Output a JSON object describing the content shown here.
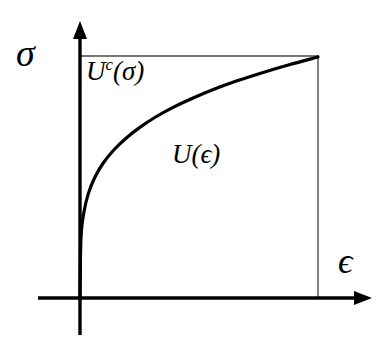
{
  "figure": {
    "background_color": "#ffffff",
    "stroke_color": "#000000",
    "axes": {
      "y_axis_label": "σ",
      "x_axis_label": "ϵ",
      "y_axis_name": "stress",
      "x_axis_name": "strain"
    },
    "regions": [
      {
        "id": "complementary",
        "label_base": "U",
        "label_superscript": "c",
        "label_argument": "(σ)",
        "label_full": "Uᶜ(σ)",
        "description": "complementary strain energy, area between curve and stress axis"
      },
      {
        "id": "strain",
        "label_base": "U",
        "label_superscript": "",
        "label_argument": "(ϵ)",
        "label_full": "U(ϵ)",
        "description": "strain energy, area between curve and strain axis"
      }
    ]
  },
  "chart_data": {
    "type": "line",
    "title": "",
    "xlabel": "ϵ",
    "ylabel": "σ",
    "xlim": [
      0,
      1
    ],
    "ylim": [
      0,
      1
    ],
    "grid": false,
    "legend": false,
    "annotations": [
      {
        "text": "Uᶜ(σ)",
        "x": 0.03,
        "y": 0.92,
        "name": "complementary-energy-label"
      },
      {
        "text": "U(ϵ)",
        "x": 0.4,
        "y": 0.58,
        "name": "strain-energy-label"
      },
      {
        "text": "σ",
        "x": -0.23,
        "y": 1.0,
        "name": "sigma-axis-label"
      },
      {
        "text": "ϵ",
        "x": 1.1,
        "y": 0.18,
        "name": "epsilon-axis-label"
      }
    ],
    "series": [
      {
        "name": "stress-strain curve",
        "relation": "sigma = epsilon^(1/4)",
        "x": [
          0.0,
          0.004,
          0.016,
          0.035,
          0.062,
          0.097,
          0.14,
          0.191,
          0.25,
          0.316,
          0.391,
          0.473,
          0.563,
          0.66,
          0.766,
          0.879,
          1.0
        ],
        "y": [
          0.0,
          0.25,
          0.354,
          0.433,
          0.5,
          0.559,
          0.612,
          0.661,
          0.707,
          0.75,
          0.791,
          0.829,
          0.866,
          0.901,
          0.935,
          0.968,
          1.0
        ]
      }
    ],
    "boundary_lines": [
      {
        "name": "top-horizontal",
        "from": [
          0,
          1
        ],
        "to": [
          1,
          1
        ],
        "weight": "thin"
      },
      {
        "name": "right-vertical",
        "from": [
          1,
          1
        ],
        "to": [
          1,
          0
        ],
        "weight": "thin"
      }
    ]
  },
  "geometry": {
    "origin_px": [
      80,
      298
    ],
    "plot_right_px": 318,
    "plot_top_px": 57,
    "x_axis_start_px": 38,
    "x_axis_end_px": 372,
    "y_axis_top_px": 21,
    "y_axis_bottom_px": 335,
    "curve_stroke_width": 3.2,
    "axis_stroke_width": 3.2,
    "box_stroke_width": 1.2
  }
}
